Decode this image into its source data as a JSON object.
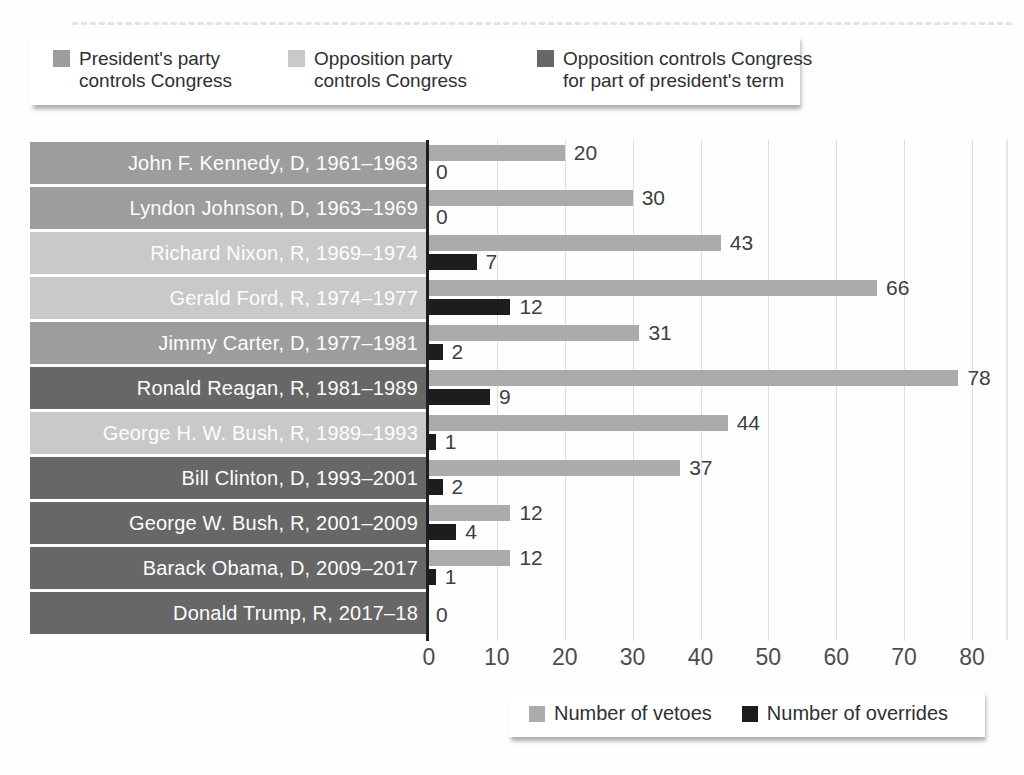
{
  "legend_top": {
    "items": [
      {
        "lines": [
          "President's party",
          "controls Congress"
        ],
        "color": "#9d9d9d",
        "key": "presidents-party"
      },
      {
        "lines": [
          "Opposition party",
          "controls Congress"
        ],
        "color": "#c9c9c9",
        "key": "opposition-party"
      },
      {
        "lines": [
          "Opposition controls Congress",
          "for part of president's term"
        ],
        "color": "#676767",
        "key": "opposition-partial"
      }
    ]
  },
  "legend_bottom": {
    "items": [
      {
        "label": "Number of vetoes",
        "color": "#ababab"
      },
      {
        "label": "Number of overrides",
        "color": "#1d1d1d"
      }
    ]
  },
  "chart_data": {
    "type": "bar",
    "orientation": "horizontal",
    "xlim": [
      0,
      80
    ],
    "xticks": [
      0,
      10,
      20,
      30,
      40,
      50,
      60,
      70,
      80
    ],
    "grid": true,
    "series_names": [
      "Number of vetoes",
      "Number of overrides"
    ],
    "series_colors": {
      "vetoes": "#ababab",
      "overrides": "#1d1d1d"
    },
    "group_colors": {
      "presidents-party": "#9d9d9d",
      "opposition-party": "#c9c9c9",
      "opposition-partial": "#676767"
    },
    "rows": [
      {
        "label": "John F. Kennedy, D, 1961–1963",
        "group": "presidents-party",
        "vetoes": 20,
        "overrides": 0
      },
      {
        "label": "Lyndon Johnson, D, 1963–1969",
        "group": "presidents-party",
        "vetoes": 30,
        "overrides": 0
      },
      {
        "label": "Richard Nixon, R, 1969–1974",
        "group": "opposition-party",
        "vetoes": 43,
        "overrides": 7
      },
      {
        "label": "Gerald Ford, R, 1974–1977",
        "group": "opposition-party",
        "vetoes": 66,
        "overrides": 12
      },
      {
        "label": "Jimmy Carter, D, 1977–1981",
        "group": "presidents-party",
        "vetoes": 31,
        "overrides": 2
      },
      {
        "label": "Ronald Reagan, R, 1981–1989",
        "group": "opposition-partial",
        "vetoes": 78,
        "overrides": 9
      },
      {
        "label": "George H. W. Bush, R, 1989–1993",
        "group": "opposition-party",
        "vetoes": 44,
        "overrides": 1
      },
      {
        "label": "Bill Clinton, D, 1993–2001",
        "group": "opposition-partial",
        "vetoes": 37,
        "overrides": 2
      },
      {
        "label": "George W. Bush, R, 2001–2009",
        "group": "opposition-partial",
        "vetoes": 12,
        "overrides": 4
      },
      {
        "label": "Barack Obama, D, 2009–2017",
        "group": "opposition-partial",
        "vetoes": 12,
        "overrides": 1
      },
      {
        "label": "Donald Trump, R, 2017–18",
        "group": "opposition-partial",
        "vetoes": 0,
        "overrides": null,
        "single_zero": true
      }
    ]
  }
}
